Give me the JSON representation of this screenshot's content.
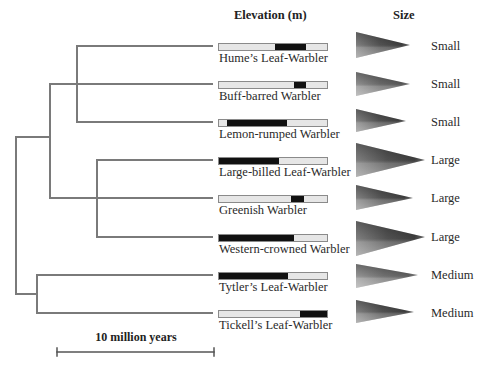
{
  "headers": {
    "elevation": "Elevation (m)",
    "size": "Size"
  },
  "scale_bar": {
    "label": "10 million years"
  },
  "colors": {
    "branch": "#7a7a7a",
    "bar_background": "#e6e6e6",
    "bar_fill": "#111111",
    "bar_border": "#8a8a8a"
  },
  "species": [
    {
      "name": "Hume’s Leaf-Warbler",
      "size": "Small",
      "elev_fill_start": 0.52,
      "elev_fill_end": 0.81
    },
    {
      "name": "Buff-barred Warbler",
      "size": "Small",
      "elev_fill_start": 0.69,
      "elev_fill_end": 0.81
    },
    {
      "name": "Lemon-rumped Warbler",
      "size": "Small",
      "elev_fill_start": 0.07,
      "elev_fill_end": 0.63
    },
    {
      "name": "Large-billed Leaf-Warbler",
      "size": "Large",
      "elev_fill_start": 0.0,
      "elev_fill_end": 0.56
    },
    {
      "name": "Greenish Warbler",
      "size": "Large",
      "elev_fill_start": 0.67,
      "elev_fill_end": 0.79
    },
    {
      "name": "Western-crowned Warbler",
      "size": "Large",
      "elev_fill_start": 0.0,
      "elev_fill_end": 0.69
    },
    {
      "name": "Tytler’s Leaf-Warbler",
      "size": "Medium",
      "elev_fill_start": 0.0,
      "elev_fill_end": 0.64
    },
    {
      "name": "Tickell’s Leaf-Warbler",
      "size": "Medium",
      "elev_fill_start": 0.75,
      "elev_fill_end": 1.0
    }
  ]
}
